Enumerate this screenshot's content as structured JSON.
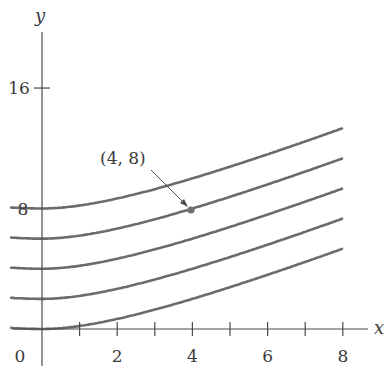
{
  "chart_data": {
    "type": "line",
    "title": "",
    "xlabel": "x",
    "ylabel": "y",
    "xlim": [
      0,
      8
    ],
    "ylim": [
      0,
      16
    ],
    "grid": false,
    "legend": null,
    "x_ticks": [
      1,
      2,
      3,
      4,
      5,
      6,
      7,
      8
    ],
    "x_tick_labels": [
      "0",
      "2",
      "4",
      "6",
      "8"
    ],
    "x_tick_label_values": [
      0,
      2,
      4,
      6,
      8
    ],
    "y_ticks": [
      16
    ],
    "y_tick_labels": [
      "8",
      "16"
    ],
    "y_tick_label_values": [
      8,
      16
    ],
    "x": [
      -0.8,
      0,
      1,
      2,
      3,
      4,
      5,
      6,
      7,
      8
    ],
    "series": [
      {
        "name": "C=8",
        "values": [
          8.13,
          8.0,
          8.2,
          8.67,
          9.29,
          10.0,
          10.78,
          11.6,
          12.45,
          13.33
        ]
      },
      {
        "name": "C=6",
        "values": [
          6.13,
          6.0,
          6.2,
          6.67,
          7.29,
          8.0,
          8.78,
          9.6,
          10.45,
          11.33
        ]
      },
      {
        "name": "C=4",
        "values": [
          4.13,
          4.0,
          4.2,
          4.67,
          5.29,
          6.0,
          6.78,
          7.6,
          8.45,
          9.33
        ]
      },
      {
        "name": "C=2",
        "values": [
          2.13,
          2.0,
          2.2,
          2.67,
          3.29,
          4.0,
          4.78,
          5.6,
          6.45,
          7.33
        ]
      },
      {
        "name": "C=0",
        "values": [
          0.13,
          0.0,
          0.2,
          0.67,
          1.29,
          2.0,
          2.78,
          3.6,
          4.45,
          5.33
        ]
      }
    ],
    "annotations": [
      {
        "text": "(4, 8)",
        "point": [
          4,
          8
        ],
        "type": "arrow-with-dot"
      }
    ]
  },
  "labels": {
    "x_axis": "x",
    "y_axis": "y",
    "origin": "0",
    "annotation": "(4, 8)"
  }
}
